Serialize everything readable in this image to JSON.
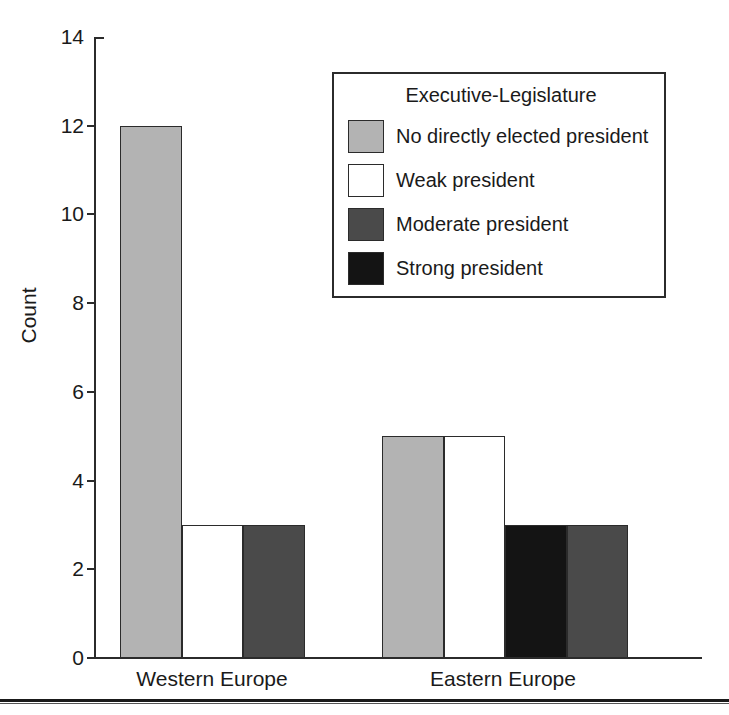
{
  "chart_data": {
    "type": "bar",
    "title": "",
    "xlabel": "",
    "ylabel": "Count",
    "ylim": [
      0,
      14
    ],
    "yticks": [
      0,
      2,
      4,
      6,
      8,
      10,
      12,
      14
    ],
    "grid": false,
    "legend_position": "upper-right-inside",
    "legend_title": "Executive-Legislature",
    "categories": [
      "Western Europe",
      "Eastern Europe"
    ],
    "series": [
      {
        "name": "No directly elected president",
        "color": "#b3b3b3",
        "values": [
          12,
          5
        ]
      },
      {
        "name": "Weak president",
        "color": "#ffffff",
        "values": [
          3,
          5
        ]
      },
      {
        "name": "Strong president",
        "color": "#141414",
        "values": [
          0,
          3
        ]
      },
      {
        "name": "Moderate president",
        "color": "#4a4a4a",
        "values": [
          3,
          3
        ]
      }
    ],
    "bars": [
      {
        "group": "Western Europe",
        "series": "No directly elected president",
        "value": 12,
        "color": "#b3b3b3"
      },
      {
        "group": "Western Europe",
        "series": "Weak president",
        "value": 3,
        "color": "#ffffff"
      },
      {
        "group": "Western Europe",
        "series": "Moderate president",
        "value": 3,
        "color": "#4a4a4a"
      },
      {
        "group": "Eastern Europe",
        "series": "No directly elected president",
        "value": 5,
        "color": "#b3b3b3"
      },
      {
        "group": "Eastern Europe",
        "series": "Weak president",
        "value": 5,
        "color": "#ffffff"
      },
      {
        "group": "Eastern Europe",
        "series": "Strong president",
        "value": 3,
        "color": "#141414"
      },
      {
        "group": "Eastern Europe",
        "series": "Moderate president",
        "value": 3,
        "color": "#4a4a4a"
      }
    ]
  },
  "axis": {
    "y_title": "Count",
    "y_tick_labels": [
      "14",
      "12",
      "10",
      "8",
      "6",
      "4",
      "2",
      "0"
    ],
    "x_group_labels": [
      "Western Europe",
      "Eastern Europe"
    ]
  },
  "legend": {
    "title": "Executive-Legislature",
    "items": [
      {
        "label": "No directly elected president",
        "color": "#b3b3b3"
      },
      {
        "label": "Weak president",
        "color": "#ffffff"
      },
      {
        "label": "Moderate president",
        "color": "#4a4a4a"
      },
      {
        "label": "Strong president",
        "color": "#141414"
      }
    ]
  },
  "colors": {
    "axis": "#2b2b2b",
    "text": "#1a1a1a",
    "light_gray": "#b3b3b3",
    "white": "#ffffff",
    "dark_gray": "#4a4a4a",
    "black": "#141414",
    "page_rule": "#1a1a1a"
  }
}
